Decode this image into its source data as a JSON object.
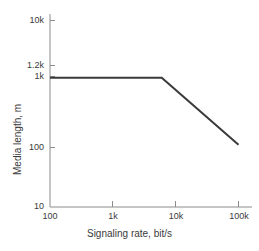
{
  "chart_data": {
    "type": "line",
    "title": "",
    "xlabel": "Signaling rate, bit/s",
    "ylabel": "Media length, m",
    "xscale": "log",
    "yscale": "log",
    "xlim": [
      100,
      100000
    ],
    "ylim": [
      10,
      10000
    ],
    "grid": false,
    "legend": null,
    "xticks": [
      {
        "value": 100,
        "label": "100"
      },
      {
        "value": 1000,
        "label": "1k"
      },
      {
        "value": 10000,
        "label": "10k"
      },
      {
        "value": 100000,
        "label": "100k"
      }
    ],
    "yticks": [
      {
        "value": 10000,
        "label": "10k"
      },
      {
        "value": 1200,
        "label": "1.2k"
      },
      {
        "value": 1000,
        "label": "1k"
      },
      {
        "value": 100,
        "label": "100"
      },
      {
        "value": 10,
        "label": "10"
      }
    ],
    "series": [
      {
        "name": "Maximum media length",
        "color": "#3a3a3a",
        "linewidth": 2,
        "points": [
          {
            "x": 100,
            "y": 1200
          },
          {
            "x": 6000,
            "y": 1200
          },
          {
            "x": 100000,
            "y": 100
          }
        ]
      }
    ],
    "annotations": []
  },
  "axis": {
    "spine_color": "#8c8c8c",
    "tick_color": "#8c8c8c",
    "text_color": "#3a3a3a"
  }
}
